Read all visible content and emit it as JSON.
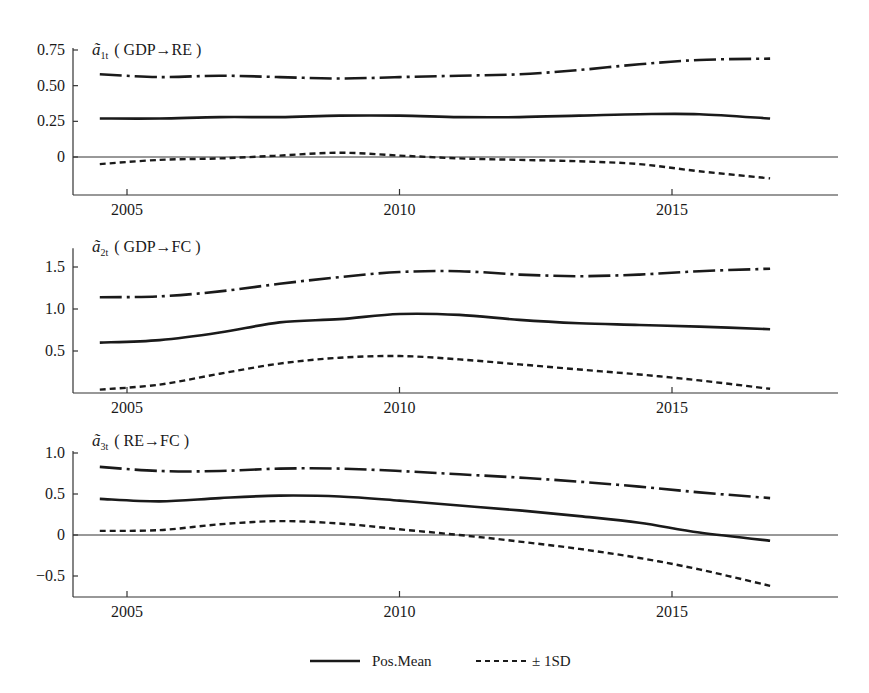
{
  "chart_data": [
    {
      "type": "line",
      "title": "ã1t ( GDP→RE )",
      "title_symbol": "ã",
      "title_subscript": "1t",
      "title_text": "( GDP→RE )",
      "xlabel": "",
      "ylabel": "",
      "x": [
        2004.5,
        2005.6,
        2006.7,
        2007.8,
        2008.9,
        2010.0,
        2011.1,
        2012.2,
        2013.3,
        2014.4,
        2015.5,
        2016.8
      ],
      "xticks": [
        2005,
        2010,
        2015
      ],
      "yticks": [
        0,
        0.25,
        0.5,
        0.75
      ],
      "ytick_labels": [
        "0",
        "0.25",
        "0.50",
        "0.75"
      ],
      "xlim": [
        2004,
        2018
      ],
      "ylim": [
        -0.13,
        0.75
      ],
      "zero_line": true,
      "grid": false,
      "series": [
        {
          "name": "+1SD",
          "style": "dashdot",
          "values": [
            0.58,
            0.56,
            0.57,
            0.56,
            0.55,
            0.56,
            0.57,
            0.58,
            0.61,
            0.65,
            0.68,
            0.69
          ]
        },
        {
          "name": "Pos.Mean",
          "style": "solid",
          "values": [
            0.27,
            0.27,
            0.28,
            0.28,
            0.29,
            0.29,
            0.28,
            0.28,
            0.29,
            0.3,
            0.3,
            0.27
          ]
        },
        {
          "name": "-1SD",
          "style": "dashed",
          "values": [
            -0.05,
            -0.02,
            -0.01,
            0.01,
            0.03,
            0.01,
            -0.01,
            -0.02,
            -0.03,
            -0.05,
            -0.1,
            -0.15
          ]
        }
      ]
    },
    {
      "type": "line",
      "title": "ã2t ( GDP→FC )",
      "title_symbol": "ã",
      "title_subscript": "2t",
      "title_text": "( GDP→FC )",
      "xlabel": "",
      "ylabel": "",
      "x": [
        2004.5,
        2005.6,
        2006.7,
        2007.8,
        2008.9,
        2010.0,
        2011.1,
        2012.2,
        2013.3,
        2014.4,
        2015.5,
        2016.8
      ],
      "xticks": [
        2005,
        2010,
        2015
      ],
      "yticks": [
        0.5,
        1.0,
        1.5
      ],
      "ytick_labels": [
        "0.5",
        "1.0",
        "1.5"
      ],
      "xlim": [
        2004,
        2018
      ],
      "ylim": [
        0,
        1.7
      ],
      "zero_line": false,
      "grid": false,
      "series": [
        {
          "name": "+1SD",
          "style": "dashdot",
          "values": [
            1.14,
            1.15,
            1.21,
            1.3,
            1.38,
            1.44,
            1.45,
            1.41,
            1.39,
            1.41,
            1.45,
            1.48
          ]
        },
        {
          "name": "Pos.Mean",
          "style": "solid",
          "values": [
            0.6,
            0.63,
            0.72,
            0.84,
            0.88,
            0.94,
            0.93,
            0.87,
            0.83,
            0.81,
            0.79,
            0.76
          ]
        },
        {
          "name": "-1SD",
          "style": "dashed",
          "values": [
            0.04,
            0.1,
            0.23,
            0.35,
            0.42,
            0.44,
            0.4,
            0.34,
            0.28,
            0.22,
            0.15,
            0.05
          ]
        }
      ]
    },
    {
      "type": "line",
      "title": "ã3t ( RE→FC )",
      "title_symbol": "ã",
      "title_subscript": "3t",
      "title_text": "( RE→FC )",
      "xlabel": "",
      "ylabel": "",
      "x": [
        2004.5,
        2005.6,
        2006.7,
        2007.8,
        2008.9,
        2010.0,
        2011.1,
        2012.2,
        2013.3,
        2014.4,
        2015.5,
        2016.8
      ],
      "xticks": [
        2005,
        2010,
        2015
      ],
      "yticks": [
        -0.5,
        0,
        0.5,
        1.0
      ],
      "ytick_labels": [
        "−0.5",
        "0",
        "0.5",
        "1.0"
      ],
      "xlim": [
        2004,
        2018
      ],
      "ylim": [
        -0.77,
        1.0
      ],
      "zero_line": true,
      "grid": false,
      "series": [
        {
          "name": "+1SD",
          "style": "dashdot",
          "values": [
            0.83,
            0.78,
            0.78,
            0.81,
            0.81,
            0.78,
            0.74,
            0.7,
            0.65,
            0.59,
            0.52,
            0.45
          ]
        },
        {
          "name": "Pos.Mean",
          "style": "solid",
          "values": [
            0.44,
            0.41,
            0.45,
            0.48,
            0.47,
            0.42,
            0.36,
            0.3,
            0.23,
            0.15,
            0.03,
            -0.07
          ]
        },
        {
          "name": "-1SD",
          "style": "dashed",
          "values": [
            0.05,
            0.06,
            0.13,
            0.17,
            0.14,
            0.07,
            0.0,
            -0.08,
            -0.17,
            -0.28,
            -0.42,
            -0.62
          ]
        }
      ]
    }
  ],
  "legend": {
    "position": "bottom-center",
    "items": [
      {
        "label": "Pos.Mean",
        "style": "solid"
      },
      {
        "label": "± 1SD",
        "style": "dashed"
      }
    ]
  },
  "colors": {
    "line": "#1a1a1a",
    "axis": "#333333",
    "background": "#ffffff"
  }
}
